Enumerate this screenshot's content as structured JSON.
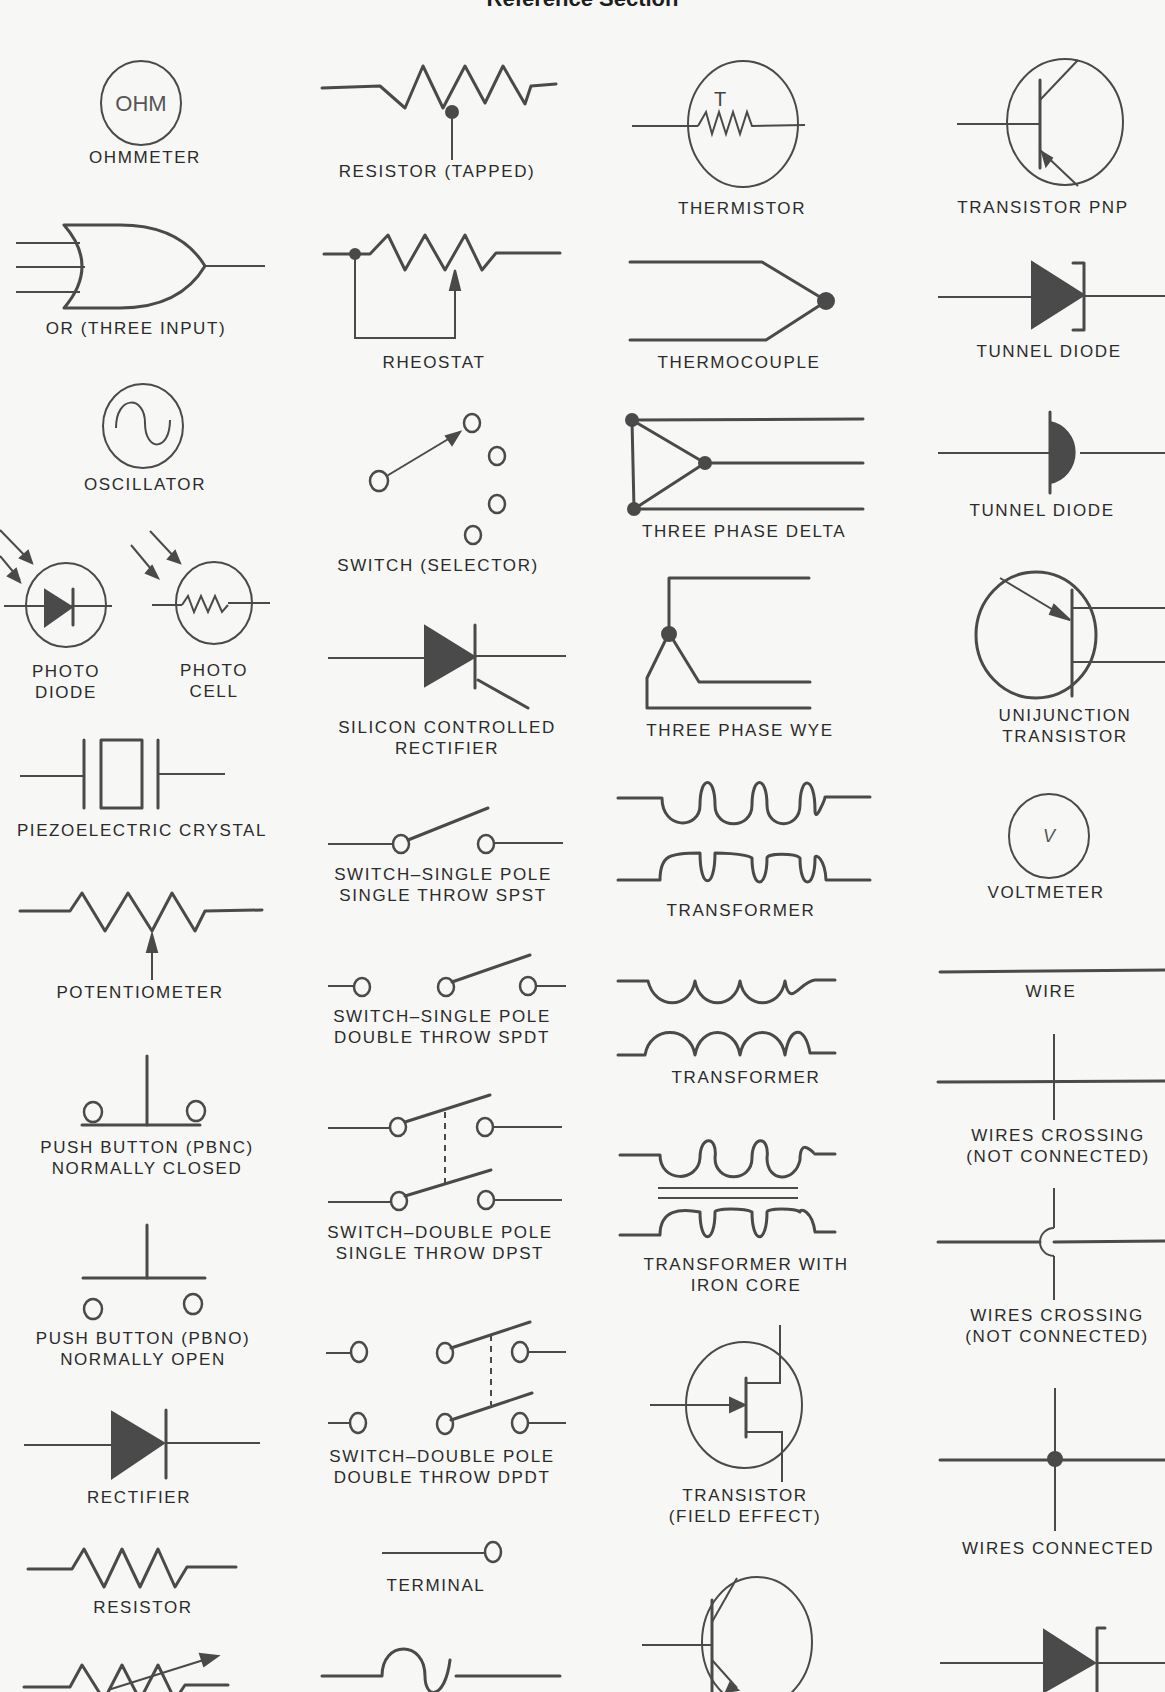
{
  "page": {
    "title": "Reference Section",
    "ink_color": "#4a4a4a",
    "background": "#f7f7f5"
  },
  "symbols": {
    "ohmmeter": {
      "label": "OHMMETER",
      "glyph": "OHM"
    },
    "resistor_tapped": {
      "label": "RESISTOR (TAPPED)"
    },
    "thermistor": {
      "label": "THERMISTOR",
      "glyph": "T"
    },
    "transistor_pnp": {
      "label": "TRANSISTOR  PNP"
    },
    "or_three_input": {
      "label": "OR (THREE INPUT)"
    },
    "rheostat": {
      "label": "RHEOSTAT"
    },
    "thermocouple": {
      "label": "THERMOCOUPLE"
    },
    "tunnel_diode_1": {
      "label": "TUNNEL DIODE"
    },
    "oscillator": {
      "label": "OSCILLATOR"
    },
    "switch_selector": {
      "label": "SWITCH (SELECTOR)"
    },
    "three_phase_delta": {
      "label": "THREE PHASE DELTA"
    },
    "tunnel_diode_2": {
      "label": "TUNNEL DIODE"
    },
    "photo_diode": {
      "label_line1": "PHOTO",
      "label_line2": "DIODE"
    },
    "photo_cell": {
      "label_line1": "PHOTO",
      "label_line2": "CELL"
    },
    "scr": {
      "label_line1": "SILICON CONTROLLED",
      "label_line2": "RECTIFIER"
    },
    "three_phase_wye": {
      "label": "THREE PHASE WYE"
    },
    "unijunction_transistor": {
      "label_line1": "UNIJUNCTION",
      "label_line2": "TRANSISTOR"
    },
    "piezoelectric_crystal": {
      "label": "PIEZOELECTRIC CRYSTAL"
    },
    "switch_spst": {
      "label_line1": "SWITCH–SINGLE POLE",
      "label_line2": "SINGLE THROW SPST"
    },
    "transformer_1": {
      "label": "TRANSFORMER"
    },
    "voltmeter": {
      "label": "VOLTMETER",
      "glyph": "V"
    },
    "potentiometer": {
      "label": "POTENTIOMETER"
    },
    "switch_spdt": {
      "label_line1": "SWITCH–SINGLE POLE",
      "label_line2": "DOUBLE THROW SPDT"
    },
    "transformer_2": {
      "label": "TRANSFORMER"
    },
    "wire": {
      "label": "WIRE"
    },
    "push_button_nc": {
      "label_line1": "PUSH BUTTON (PBNC)",
      "label_line2": "NORMALLY CLOSED"
    },
    "switch_dpst": {
      "label_line1": "SWITCH–DOUBLE POLE",
      "label_line2": "SINGLE THROW DPST"
    },
    "transformer_iron_core": {
      "label_line1": "TRANSFORMER WITH",
      "label_line2": "IRON CORE"
    },
    "wires_crossing_1": {
      "label_line1": "WIRES CROSSING",
      "label_line2": "(NOT CONNECTED)"
    },
    "push_button_no": {
      "label_line1": "PUSH BUTTON (PBNO)",
      "label_line2": "NORMALLY OPEN"
    },
    "switch_dpdt": {
      "label_line1": "SWITCH–DOUBLE POLE",
      "label_line2": "DOUBLE THROW DPDT"
    },
    "transistor_fet": {
      "label_line1": "TRANSISTOR",
      "label_line2": "(FIELD EFFECT)"
    },
    "wires_crossing_2": {
      "label_line1": "WIRES CROSSING",
      "label_line2": "(NOT CONNECTED)"
    },
    "rectifier": {
      "label": "RECTIFIER"
    },
    "wires_connected": {
      "label": "WIRES CONNECTED"
    },
    "resistor": {
      "label": "RESISTOR"
    },
    "terminal": {
      "label": "TERMINAL"
    }
  }
}
